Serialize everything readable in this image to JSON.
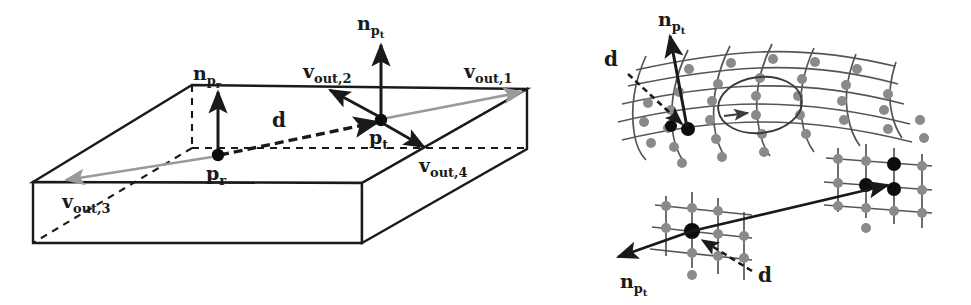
{
  "figure": {
    "background_color": "#ffffff",
    "ink_color": "#1a1a1a",
    "gray_arrow_color": "#9a9a9a",
    "mesh_node_color": "#808080",
    "mesh_line_color": "#555555"
  },
  "panels": {
    "left": {
      "name": "slab-box-panel",
      "description": "3D slab box with reference point p_r and target point p_t, normals and four outgoing vectors",
      "labels": {
        "n_pr": {
          "base": "n",
          "sub": "p",
          "sub2": "r",
          "text": "n_pr"
        },
        "n_pt": {
          "base": "n",
          "sub": "p",
          "sub2": "t",
          "text": "n_pt"
        },
        "p_r": {
          "base": "p",
          "sub": "r",
          "text": "p_r"
        },
        "p_t": {
          "base": "p",
          "sub": "t",
          "text": "p_t"
        },
        "d": {
          "base": "d",
          "text": "d"
        },
        "v_out_1": {
          "base": "v",
          "sub": "out,1",
          "text": "v_out,1"
        },
        "v_out_2": {
          "base": "v",
          "sub": "out,2",
          "text": "v_out,2"
        },
        "v_out_3": {
          "base": "v",
          "sub": "out,3",
          "text": "v_out,3"
        },
        "v_out_4": {
          "base": "v",
          "sub": "out,4",
          "text": "v_out,4"
        }
      }
    },
    "top_right": {
      "name": "curved-mesh-panel",
      "description": "Curved triangulated mesh patch with surface normal n_pt at a dark vertex and a dashed displacement d",
      "labels": {
        "n_pt": {
          "base": "n",
          "sub": "p",
          "sub2": "t",
          "text": "n_pt"
        },
        "d": {
          "base": "d",
          "text": "d"
        }
      }
    },
    "bottom_right": {
      "name": "two-mesh-panel",
      "description": "Two separated mesh patches joined by a long straight vector; normal n_pt points down-left and dashed d annotation",
      "labels": {
        "n_pt": {
          "base": "n",
          "sub": "p",
          "sub2": "t",
          "text": "n_pt"
        },
        "d": {
          "base": "d",
          "text": "d"
        }
      }
    }
  }
}
